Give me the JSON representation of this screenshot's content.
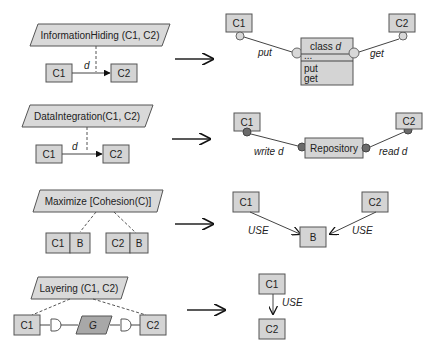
{
  "rows": [
    {
      "pattern": {
        "title": "InformationHiding (C1, C2)",
        "source": "C1",
        "target": "C2",
        "edge_label": "d"
      },
      "result": {
        "left": "C1",
        "right": "C2",
        "center_title": "class d",
        "center_compartment": "...",
        "center_ops": [
          "put",
          "get"
        ],
        "left_label": "put",
        "right_label": "get"
      }
    },
    {
      "pattern": {
        "title": "DataIntegration(C1, C2)",
        "source": "C1",
        "target": "C2",
        "edge_label": "d"
      },
      "result": {
        "left": "C1",
        "right": "C2",
        "center": "Repository",
        "left_label": "write d",
        "right_label": "read d"
      }
    },
    {
      "pattern": {
        "title": "Maximize [Cohesion(C)]",
        "left_pair": [
          "C1",
          "B"
        ],
        "right_pair": [
          "C2",
          "B"
        ]
      },
      "result": {
        "left": "C1",
        "right": "C2",
        "center": "B",
        "left_label": "USE",
        "right_label": "USE"
      }
    },
    {
      "pattern": {
        "title": "Layering (C1, C2)",
        "left": "C1",
        "middle": "G",
        "right": "C2"
      },
      "result": {
        "top": "C1",
        "bottom": "C2",
        "edge_label": "USE"
      }
    }
  ],
  "colors": {
    "box_fill": "#d4d4d4",
    "stroke": "#555555",
    "dark_ball": "#6b6b6b",
    "g_fill": "#a8a8a8"
  }
}
